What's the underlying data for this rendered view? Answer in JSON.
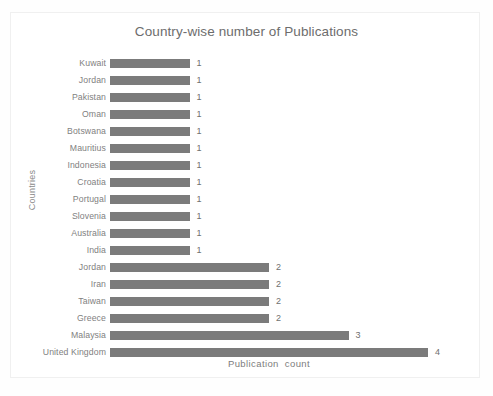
{
  "chart_data": {
    "type": "bar",
    "orientation": "horizontal",
    "title": "Country-wise number of Publications",
    "xlabel": "Publication  count",
    "ylabel": "Countries",
    "categories": [
      "Kuwait",
      "Jordan",
      "Pakistan",
      "Oman",
      "Botswana",
      "Mauritius",
      "Indonesia",
      "Croatia",
      "Portugal",
      "Slovenia",
      "Australia",
      "India",
      "Jordan",
      "Iran",
      "Taiwan",
      "Greece",
      "Malaysia",
      "United Kingdom"
    ],
    "values": [
      1,
      1,
      1,
      1,
      1,
      1,
      1,
      1,
      1,
      1,
      1,
      1,
      2,
      2,
      2,
      2,
      3,
      4
    ],
    "data_labels": [
      "1",
      "1",
      "1",
      "1",
      "1",
      "1",
      "1",
      "1",
      "1",
      "1",
      "1",
      "1",
      "2",
      "2",
      "2",
      "2",
      "3",
      "4"
    ],
    "xlim": [
      0,
      4
    ],
    "grid": false,
    "legend": false,
    "bar_color": "#7b7b7b",
    "title_color": "#6d6d6d",
    "label_color": "#7f7f7f",
    "background_color": "#ffffff"
  }
}
